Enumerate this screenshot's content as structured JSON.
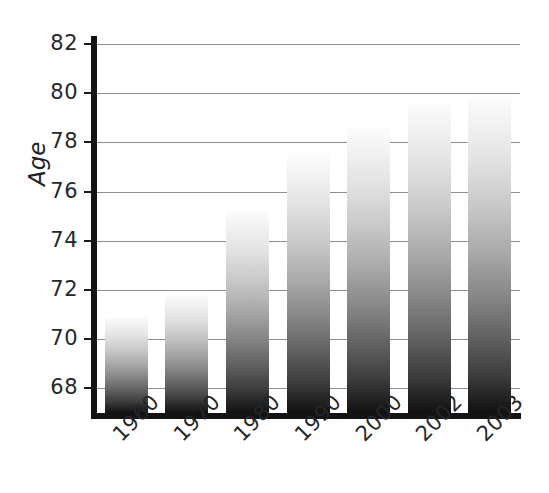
{
  "chart_data": {
    "type": "bar",
    "title": "",
    "subtitle": "",
    "xlabel": "",
    "ylabel": "Age",
    "categories": [
      "1960",
      "1970",
      "1980",
      "1990",
      "2000",
      "2002",
      "2003"
    ],
    "values": [
      70.9,
      71.8,
      75.2,
      77.5,
      78.6,
      79.6,
      79.8
    ],
    "ylim": [
      67.0,
      82.0
    ],
    "yticks": [
      68,
      70,
      72,
      74,
      76,
      78,
      80,
      82
    ],
    "ytick_labels": [
      "68",
      "70",
      "72",
      "74",
      "76",
      "78",
      "80",
      "82"
    ],
    "grid": true,
    "grid_axis": "y",
    "legend": false,
    "legend_position": "none",
    "bar_fill": "vertical-gradient-white-to-black",
    "colors": {
      "axis": "#111315",
      "grid": "#8d8d8d",
      "text": "#232629",
      "bar_top": "#fcfcfc",
      "bar_bottom": "#111111",
      "background": "#ffffff"
    }
  },
  "axis": {
    "y_title": "Age"
  }
}
